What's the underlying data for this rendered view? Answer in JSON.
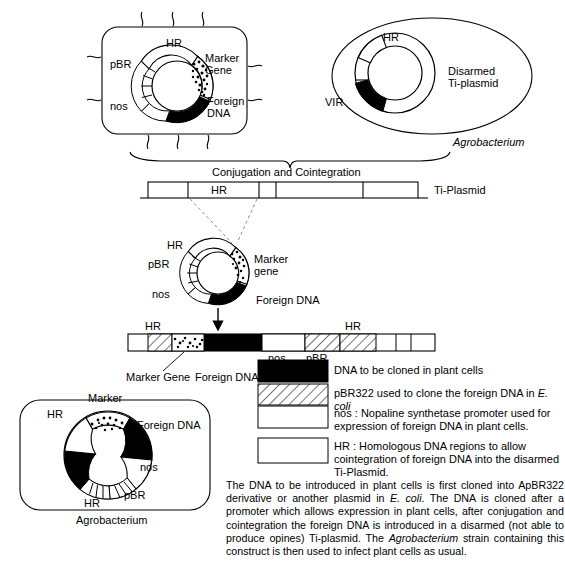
{
  "diagram": {
    "title_implicit": "Agrobacterium-mediated plant transformation via cointegration",
    "top_left_cell": {
      "name": "E. coli cell with recombinant pBR-based plasmid",
      "plasmid_labels": {
        "hr": "HR",
        "pbr": "pBR",
        "nos": "nos",
        "marker_gene": "Marker\nGene",
        "marker_gene_line1": "Marker",
        "marker_gene_line2": "Gene",
        "foreign_dna_line1": "Foreign",
        "foreign_dna_line2": "DNA"
      }
    },
    "top_right_cell": {
      "organism": "Agrobacterium",
      "plasmid_labels": {
        "hr": "HR",
        "vir": "VIR",
        "disarmed_line1": "Disarmed",
        "disarmed_line2": "Ti-plasmid"
      }
    },
    "conjugation": {
      "caption": "Conjugation and Cointegration",
      "ti_plasmid_label": "Ti-Plasmid",
      "bar_hr_label": "HR"
    },
    "middle_plasmid": {
      "hr": "HR",
      "pbr": "pBR",
      "nos": "nos",
      "marker_line1": "Marker",
      "marker_line2": "gene",
      "foreign_dna": "Foreign DNA"
    },
    "integrated_construct": {
      "hr_left": "HR",
      "hr_right": "HR",
      "nos": "nos",
      "pbr": "pBR",
      "marker_gene": "Marker Gene",
      "foreign_dna": "Foreign DNA"
    },
    "bottom_left_cell": {
      "organism": "Agrobacterium",
      "plasmid_labels": {
        "marker": "Marker",
        "hr_upper_left": "HR",
        "hr_bottom": "HR",
        "pbr": "pBR",
        "nos": "nos",
        "foreign_dna": "Foreign DNA"
      }
    }
  },
  "legend": {
    "items": [
      {
        "key": "solid-black",
        "fill": "black",
        "text": "DNA to be cloned in plant cells"
      },
      {
        "key": "hatched",
        "fill": "hatch",
        "text_before": "pBR322 used to clone the foreign DNA in ",
        "text_italic": "E. coli",
        "text_after": ""
      },
      {
        "key": "open-nos",
        "fill": "white",
        "text": "nos : Nopaline synthetase promoter used for expression of foreign DNA in plant cells."
      },
      {
        "key": "open-hr",
        "fill": "white",
        "text": "HR : Homologous DNA regions to allow cointegration of foreign DNA into the disarmed Ti-Plasmid."
      }
    ]
  },
  "caption": {
    "part1": "The DNA to be introduced in plant cells is first cloned into ApBR322 derivative or another plasmid in ",
    "italic1": "E. coli",
    "part2": ". The DNA is cloned after a promoter which allows expression in plant cells, after conjugation and cointegration the foreign DNA is introduced in a disarmed (not able to produce opines) Ti-plasmid. The ",
    "italic2": "Agrobacterium",
    "part3": " strain containing this construct is then used to infect plant cells as usual."
  },
  "colors": {
    "ink": "#000000",
    "paper": "#ffffff",
    "dashed": "#7a7a7a"
  }
}
